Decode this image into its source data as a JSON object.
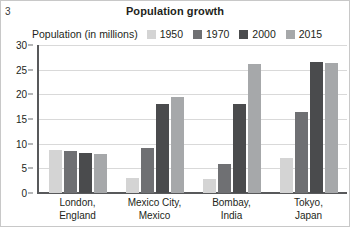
{
  "page_marker": "3",
  "chart_data": {
    "type": "bar",
    "title": "Population growth",
    "legend_title": "Population (in millions)",
    "legend_position": "top",
    "grid": true,
    "xlabel": "",
    "ylabel": "",
    "ylim": [
      0,
      30
    ],
    "yticks": [
      0,
      5,
      10,
      15,
      20,
      25,
      30
    ],
    "ytick_labels": [
      "0",
      "5",
      "10",
      "15",
      "20",
      "25",
      "30"
    ],
    "categories": [
      "London, England",
      "Mexico City, Mexico",
      "Bombay, India",
      "Tokyo, Japan"
    ],
    "category_lines": [
      [
        "London,",
        "England"
      ],
      [
        "Mexico City,",
        "Mexico"
      ],
      [
        "Bombay,",
        "India"
      ],
      [
        "Tokyo,",
        "Japan"
      ]
    ],
    "series": [
      {
        "name": "1950",
        "color": "#d4d4d4",
        "values": [
          8.8,
          3.1,
          2.9,
          7.0
        ]
      },
      {
        "name": "1970",
        "color": "#6f7073",
        "values": [
          8.6,
          9.1,
          5.9,
          16.5
        ]
      },
      {
        "name": "2000",
        "color": "#4a4b4d",
        "values": [
          8.2,
          18.1,
          18.1,
          26.5
        ]
      },
      {
        "name": "2015",
        "color": "#a6a8aa",
        "values": [
          8.0,
          19.4,
          26.1,
          26.4
        ]
      }
    ]
  }
}
